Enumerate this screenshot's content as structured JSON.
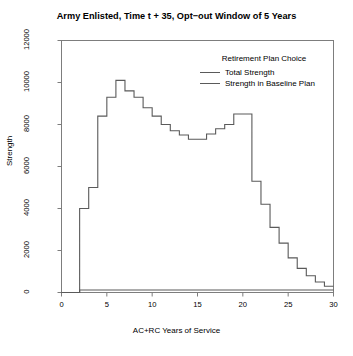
{
  "chart_data": {
    "type": "line",
    "title": "Army Enlisted, Time t + 35, Opt−out Window of 5 Years",
    "subtitle": "",
    "xlabel": "AC+RC Years of Service",
    "ylabel": "Strength",
    "xlim": [
      0,
      30
    ],
    "ylim": [
      0,
      12000
    ],
    "xticks": [
      0,
      5,
      10,
      15,
      20,
      25,
      30
    ],
    "xtick_labels": [
      "0",
      "5",
      "10",
      "15",
      "20",
      "25",
      "30"
    ],
    "yticks": [
      0,
      2000,
      4000,
      6000,
      8000,
      10000,
      12000
    ],
    "ytick_labels": [
      "0",
      "2000",
      "4000",
      "6000",
      "8000",
      "10000",
      "12000"
    ],
    "grid": false,
    "step_style": "post",
    "legend": {
      "title": "Retirement Plan Choice",
      "position": "top-right-inside",
      "entries": [
        {
          "name": "Total Strength",
          "color": "#5a5a5a"
        },
        {
          "name": "Strength in Baseline Plan",
          "color": "#5a5a5a"
        }
      ]
    },
    "x": [
      0,
      1,
      2,
      3,
      4,
      5,
      6,
      7,
      8,
      9,
      10,
      11,
      12,
      13,
      14,
      15,
      16,
      17,
      18,
      19,
      20,
      21,
      22,
      23,
      24,
      25,
      26,
      27,
      28,
      29
    ],
    "series": [
      {
        "name": "Total Strength",
        "color": "#5a5a5a",
        "values": [
          0,
          0,
          4000,
          5000,
          8400,
          9300,
          10100,
          9600,
          9300,
          8800,
          8400,
          8000,
          7700,
          7500,
          7300,
          7300,
          7550,
          7800,
          8000,
          8500,
          8500,
          5300,
          4200,
          3100,
          2350,
          1650,
          1150,
          800,
          500,
          300
        ]
      },
      {
        "name": "Strength in Baseline Plan",
        "color": "#5a5a5a",
        "values": [
          0,
          0,
          120,
          120,
          120,
          120,
          120,
          120,
          120,
          120,
          120,
          120,
          120,
          120,
          120,
          120,
          120,
          120,
          120,
          120,
          120,
          120,
          120,
          120,
          120,
          120,
          120,
          120,
          120,
          120
        ]
      }
    ]
  },
  "colors": {
    "line": "#5a5a5a",
    "frame": "#7d7d7d",
    "text": "#000000",
    "background": "#ffffff"
  }
}
